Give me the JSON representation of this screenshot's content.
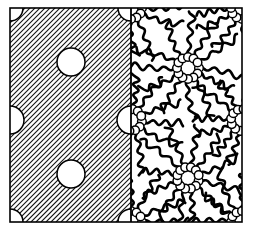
{
  "figure": {
    "background_color": "#ffffff",
    "ink_color": "#000000",
    "frame": {
      "x": 10,
      "y": 8,
      "width": 232,
      "height": 214,
      "stroke_width": 1.6,
      "divider_x": 131,
      "divider_stroke_width": 1.8
    }
  },
  "panels": [
    {
      "id": "left-panel",
      "name": "hatched-solid-phase",
      "region": {
        "x": 10,
        "y": 8,
        "width": 121,
        "height": 214
      },
      "fill": "#ffffff",
      "hatch": {
        "angle_deg": 45,
        "direction": "lower-left-to-upper-right",
        "spacing_px": 5,
        "stroke_width": 1.1,
        "color": "#111111"
      },
      "circles": [
        {
          "name": "pore-corner-top-left",
          "cx": 10,
          "cy": 8,
          "r": 13,
          "clip": "quarter"
        },
        {
          "name": "pore-corner-top-right",
          "cx": 131,
          "cy": 8,
          "r": 13,
          "clip": "quarter"
        },
        {
          "name": "pore-corner-bottom-left",
          "cx": 10,
          "cy": 222,
          "r": 13,
          "clip": "quarter"
        },
        {
          "name": "pore-corner-bottom-right",
          "cx": 131,
          "cy": 222,
          "r": 13,
          "clip": "quarter"
        },
        {
          "name": "pore-edge-left-mid",
          "cx": 10,
          "cy": 120,
          "r": 14,
          "clip": "half"
        },
        {
          "name": "pore-edge-right-mid",
          "cx": 131,
          "cy": 120,
          "r": 14,
          "clip": "half"
        },
        {
          "name": "pore-interior-upper",
          "cx": 71,
          "cy": 62,
          "r": 14,
          "clip": "full"
        },
        {
          "name": "pore-interior-lower",
          "cx": 71,
          "cy": 174,
          "r": 14,
          "clip": "full"
        }
      ]
    },
    {
      "id": "right-panel",
      "name": "micelle-array-phase",
      "region": {
        "x": 131,
        "y": 8,
        "width": 111,
        "height": 214
      },
      "fill": "#ffffff",
      "micelles": [
        {
          "name": "micelle-center-upper",
          "cx": 188,
          "cy": 68,
          "head_r": 4.3,
          "ring_r": 11,
          "head_count": 12,
          "tail_count": 12,
          "tail_len": 40,
          "clip": "full",
          "phase": 0
        },
        {
          "name": "micelle-center-lower",
          "cx": 188,
          "cy": 178,
          "head_r": 4.3,
          "ring_r": 11,
          "head_count": 12,
          "tail_count": 12,
          "tail_len": 40,
          "clip": "full",
          "phase": 15
        },
        {
          "name": "micelle-corner-top-left",
          "cx": 131,
          "cy": 8,
          "head_r": 4.3,
          "ring_r": 11,
          "head_count": 12,
          "tail_count": 12,
          "tail_len": 38,
          "clip": "quarter",
          "phase": 0
        },
        {
          "name": "micelle-corner-top-right",
          "cx": 242,
          "cy": 8,
          "head_r": 4.3,
          "ring_r": 11,
          "head_count": 12,
          "tail_count": 12,
          "tail_len": 38,
          "clip": "quarter",
          "phase": 0
        },
        {
          "name": "micelle-corner-bottom-left",
          "cx": 131,
          "cy": 222,
          "head_r": 4.3,
          "ring_r": 11,
          "head_count": 12,
          "tail_count": 12,
          "tail_len": 38,
          "clip": "quarter",
          "phase": 0
        },
        {
          "name": "micelle-corner-bottom-right",
          "cx": 242,
          "cy": 222,
          "head_r": 4.3,
          "ring_r": 11,
          "head_count": 12,
          "tail_count": 12,
          "tail_len": 38,
          "clip": "quarter",
          "phase": 0
        },
        {
          "name": "micelle-edge-left-mid",
          "cx": 131,
          "cy": 120,
          "head_r": 4.3,
          "ring_r": 11,
          "head_count": 12,
          "tail_count": 12,
          "tail_len": 38,
          "clip": "half",
          "phase": 8
        },
        {
          "name": "micelle-edge-right-mid",
          "cx": 242,
          "cy": 120,
          "head_r": 4.3,
          "ring_r": 11,
          "head_count": 12,
          "tail_count": 12,
          "tail_len": 38,
          "clip": "half",
          "phase": 8
        }
      ],
      "tail_style": {
        "stroke_width": 2.6,
        "color": "#000000",
        "wave_amplitude": 3.4,
        "wave_periods": 3.1,
        "linecap": "round"
      },
      "head_style": {
        "stroke_width": 1.5,
        "stroke_color": "#000000",
        "fill": "#ffffff"
      }
    }
  ]
}
